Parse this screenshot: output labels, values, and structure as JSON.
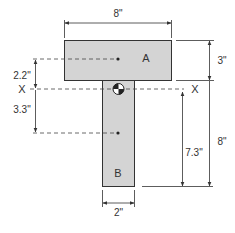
{
  "diagram": {
    "colors": {
      "fill": "#d4d4d4",
      "stroke": "#333333",
      "background": "#ffffff"
    },
    "parts": {
      "A": {
        "label": "A"
      },
      "B": {
        "label": "B"
      }
    },
    "axis": {
      "left_label": "X",
      "right_label": "X"
    },
    "dimensions": {
      "flange_width": "8\"",
      "flange_height": "3\"",
      "web_width": "2\"",
      "web_height": "8\"",
      "centroid_to_A": "2.2\"",
      "centroid_to_B": "3.3\"",
      "centroid_to_bottom": "7.3\""
    }
  }
}
